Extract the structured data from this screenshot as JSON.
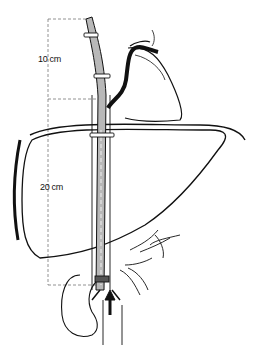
{
  "figure": {
    "type": "anatomical-illustration",
    "labels": {
      "upper_segment": "10 cm",
      "lower_segment": "20 cm"
    },
    "colors": {
      "line": "#111111",
      "tube_fill": "#b8b8b8",
      "dash": "#777777",
      "background": "#ffffff"
    }
  }
}
